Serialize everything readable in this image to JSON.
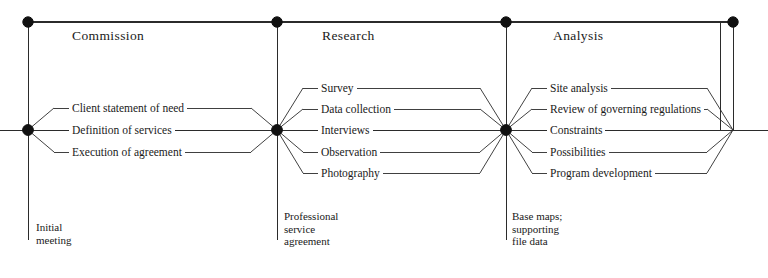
{
  "diagram": {
    "line_color": "#2b2b2b",
    "node_color": "#111111",
    "background": "#ffffff",
    "phases": [
      {
        "name": "Commission",
        "title_x": 72,
        "title_y": 28,
        "start_x": 28,
        "end_x": 277,
        "branches": [
          {
            "label": "Client statement of need",
            "y": 108
          },
          {
            "label": "Definition of services",
            "y": 130
          },
          {
            "label": "Execution of agreement",
            "y": 152
          }
        ],
        "deliverable": {
          "text": "Initial\nmeeting",
          "x": 36,
          "y": 221
        }
      },
      {
        "name": "Research",
        "title_x": 322,
        "title_y": 28,
        "start_x": 277,
        "end_x": 506,
        "branches": [
          {
            "label": "Survey",
            "y": 88
          },
          {
            "label": "Data collection",
            "y": 109
          },
          {
            "label": "Interviews",
            "y": 130
          },
          {
            "label": "Observation",
            "y": 152
          },
          {
            "label": "Photography",
            "y": 173
          }
        ],
        "deliverable": {
          "text": "Professional\nservice\nagreement",
          "x": 284,
          "y": 210
        }
      },
      {
        "name": "Analysis",
        "title_x": 553,
        "title_y": 28,
        "start_x": 506,
        "end_x": 733,
        "branches": [
          {
            "label": "Site analysis",
            "y": 88
          },
          {
            "label": "Review of governing regulations",
            "y": 109
          },
          {
            "label": "Constraints",
            "y": 130
          },
          {
            "label": "Possibilities",
            "y": 152
          },
          {
            "label": "Program development",
            "y": 173
          }
        ],
        "deliverable": {
          "text": "Base maps;\nsupporting\nfile data",
          "x": 512,
          "y": 210
        }
      }
    ],
    "nodes": [
      {
        "name": "commission-top-node",
        "x": 28,
        "y": 22,
        "r": 5.2,
        "filled": true
      },
      {
        "name": "research-top-node",
        "x": 277,
        "y": 22,
        "r": 5.2,
        "filled": true
      },
      {
        "name": "analysis-top-node",
        "x": 506,
        "y": 22,
        "r": 5.2,
        "filled": true
      },
      {
        "name": "completion-top-node",
        "x": 733,
        "y": 22,
        "r": 5.2,
        "filled": true
      },
      {
        "name": "commission-axis-node",
        "x": 28,
        "y": 130,
        "r": 5.4,
        "filled": true
      },
      {
        "name": "research-axis-node",
        "x": 277,
        "y": 130,
        "r": 5.4,
        "filled": true
      },
      {
        "name": "analysis-axis-node",
        "x": 506,
        "y": 130,
        "r": 5.4,
        "filled": true
      }
    ],
    "axis": {
      "y": 130,
      "x_start": 0,
      "x_end": 768
    },
    "timeline": {
      "y": 22,
      "x_start": 28,
      "x_end": 733
    },
    "dividers": [
      {
        "name": "divider-commission-start",
        "x": 28,
        "y_top": 22,
        "y_bottom": 240
      },
      {
        "name": "divider-research-start",
        "x": 277,
        "y_top": 22,
        "y_bottom": 240
      },
      {
        "name": "divider-analysis-start",
        "x": 506,
        "y_top": 22,
        "y_bottom": 240
      },
      {
        "name": "divider-analysis-end",
        "x": 720,
        "y_top": 22,
        "y_bottom": 130
      },
      {
        "name": "divider-completion",
        "x": 733,
        "y_top": 22,
        "y_bottom": 130
      }
    ]
  }
}
